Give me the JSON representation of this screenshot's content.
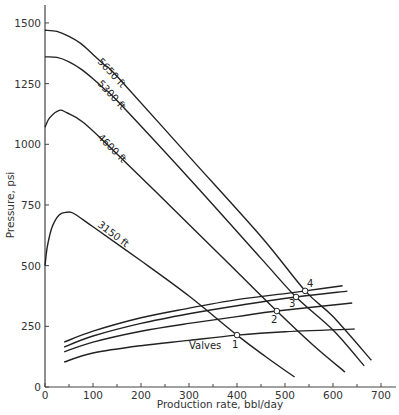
{
  "chart_data": {
    "type": "line",
    "title": "",
    "xlabel": "Production rate, bbl/day",
    "ylabel": "Pressure, psi",
    "xlim": [
      0,
      700
    ],
    "ylim": [
      0,
      1500
    ],
    "xticks": [
      0,
      100,
      200,
      300,
      400,
      500,
      600,
      700
    ],
    "xminor": [
      50,
      150,
      250,
      350,
      450,
      550,
      650
    ],
    "yticks": [
      0,
      250,
      500,
      750,
      1000,
      1250,
      1500
    ],
    "grid": false,
    "series": [
      {
        "name": "5650 ft",
        "label_at": [
          150,
          1270
        ],
        "points": [
          [
            0,
            1470
          ],
          [
            25,
            1465
          ],
          [
            50,
            1445
          ],
          [
            75,
            1415
          ],
          [
            100,
            1370
          ],
          [
            125,
            1325
          ],
          [
            150,
            1280
          ],
          [
            300,
            950
          ],
          [
            450,
            620
          ],
          [
            542,
            396
          ],
          [
            600,
            290
          ],
          [
            680,
            110
          ]
        ]
      },
      {
        "name": "5300 ft",
        "label_at": [
          150,
          1170
        ],
        "points": [
          [
            0,
            1360
          ],
          [
            25,
            1358
          ],
          [
            50,
            1340
          ],
          [
            75,
            1310
          ],
          [
            100,
            1270
          ],
          [
            125,
            1225
          ],
          [
            150,
            1180
          ],
          [
            300,
            860
          ],
          [
            450,
            530
          ],
          [
            523,
            371
          ],
          [
            600,
            235
          ],
          [
            665,
            87
          ]
        ]
      },
      {
        "name": "4600 ft",
        "label_at": [
          150,
          940
        ],
        "points": [
          [
            0,
            1070
          ],
          [
            10,
            1110
          ],
          [
            30,
            1140
          ],
          [
            45,
            1130
          ],
          [
            80,
            1090
          ],
          [
            150,
            960
          ],
          [
            300,
            670
          ],
          [
            400,
            475
          ],
          [
            483,
            313
          ],
          [
            560,
            170
          ],
          [
            625,
            62
          ]
        ]
      },
      {
        "name": "3150 ft",
        "label_at": [
          130,
          640
        ],
        "points": [
          [
            0,
            500
          ],
          [
            5,
            580
          ],
          [
            15,
            660
          ],
          [
            30,
            710
          ],
          [
            45,
            720
          ],
          [
            60,
            715
          ],
          [
            100,
            660
          ],
          [
            200,
            520
          ],
          [
            300,
            375
          ],
          [
            400,
            214
          ],
          [
            460,
            125
          ],
          [
            520,
            41
          ]
        ]
      },
      {
        "name": "Valves 4",
        "points": [
          [
            40,
            185
          ],
          [
            100,
            230
          ],
          [
            200,
            285
          ],
          [
            300,
            325
          ],
          [
            400,
            360
          ],
          [
            500,
            385
          ],
          [
            542,
            396
          ],
          [
            620,
            417
          ]
        ]
      },
      {
        "name": "Valves 3",
        "points": [
          [
            40,
            165
          ],
          [
            100,
            210
          ],
          [
            200,
            262
          ],
          [
            300,
            302
          ],
          [
            400,
            335
          ],
          [
            523,
            371
          ],
          [
            630,
            395
          ]
        ]
      },
      {
        "name": "Valves 2",
        "points": [
          [
            40,
            145
          ],
          [
            100,
            185
          ],
          [
            200,
            230
          ],
          [
            300,
            262
          ],
          [
            400,
            290
          ],
          [
            483,
            313
          ],
          [
            640,
            346
          ]
        ]
      },
      {
        "name": "Valves 1",
        "label": "Valves",
        "label_at": [
          230,
          160
        ],
        "points": [
          [
            40,
            103
          ],
          [
            100,
            140
          ],
          [
            200,
            170
          ],
          [
            300,
            192
          ],
          [
            400,
            214
          ],
          [
            500,
            228
          ],
          [
            645,
            239
          ]
        ]
      }
    ],
    "annotations": [
      {
        "label": "1",
        "x": 400,
        "y": 214
      },
      {
        "label": "2",
        "x": 483,
        "y": 313
      },
      {
        "label": "3",
        "x": 523,
        "y": 371
      },
      {
        "label": "4",
        "x": 542,
        "y": 396
      }
    ]
  },
  "labels": {
    "x_axis_title": "Production rate, bbl/day",
    "y_axis_title": "Pressure, psi",
    "valves": "Valves",
    "curve_5650": "5650 ft",
    "curve_5300": "5300 ft",
    "curve_4600": "4600 ft",
    "curve_3150": "3150 ft",
    "pt1": "1",
    "pt2": "2",
    "pt3": "3",
    "pt4": "4"
  },
  "colors": {
    "line": "#222222",
    "axis": "#444444",
    "background": "#ffffff"
  }
}
